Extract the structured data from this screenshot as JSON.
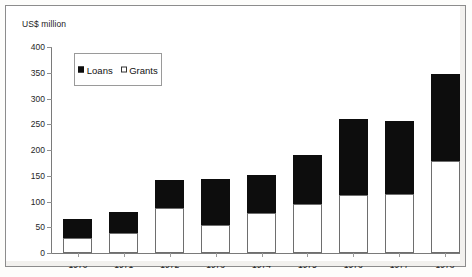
{
  "axis_unit_label": "US$ million",
  "legend": {
    "entries": [
      {
        "label": "Loans",
        "swatch": "filled-square",
        "color": "#0d0d0d"
      },
      {
        "label": "Grants",
        "swatch": "open-square",
        "color": "#ffffff"
      }
    ]
  },
  "chart_data": {
    "type": "bar",
    "subtype": "stacked-vertical",
    "title": "",
    "subtitle": "",
    "xlabel": "",
    "ylabel": "US$ million",
    "ylim": [
      0,
      400
    ],
    "ytick_values": [
      0,
      50,
      100,
      150,
      200,
      250,
      300,
      350,
      400
    ],
    "ytick_labels": [
      "0",
      "50",
      "100",
      "150",
      "200",
      "250",
      "300",
      "350",
      "400"
    ],
    "grid": false,
    "legend_position": "top-left-inset",
    "categories": [
      "1970",
      "1971",
      "1972",
      "1973",
      "1974",
      "1975",
      "1976",
      "1977",
      "1978"
    ],
    "series": [
      {
        "name": "Grants",
        "color": "#ffffff",
        "edge_color": "#6e6e6e",
        "values": [
          29,
          38,
          88,
          55,
          78,
          95,
          113,
          115,
          178
        ]
      },
      {
        "name": "Loans",
        "color": "#0d0d0d",
        "edge_color": "#0d0d0d",
        "values": [
          37,
          42,
          54,
          88,
          74,
          95,
          147,
          142,
          170
        ]
      }
    ],
    "totals": [
      66,
      80,
      142,
      143,
      152,
      190,
      260,
      257,
      348
    ]
  },
  "colors": {
    "loans": "#0d0d0d",
    "grants": "#ffffff",
    "axis": "#7a7a7a",
    "text": "#262626",
    "frame": "#8c8c8c"
  }
}
